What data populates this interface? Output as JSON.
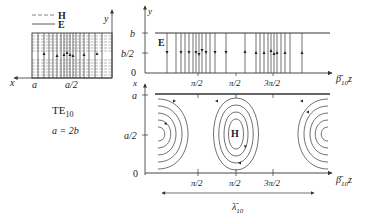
{
  "legend": {
    "h_label": "H",
    "e_label": "E",
    "h_style": "dashed",
    "e_style": "solid"
  },
  "cross_section": {
    "x_axis_label": "x",
    "y_axis_label": "y",
    "tick_a": "a",
    "tick_a_half": "a/2"
  },
  "mode": {
    "name": "TE",
    "subscript": "10",
    "relation": "a = 2b"
  },
  "e_plot": {
    "field_label": "E",
    "y_axis_label": "y",
    "y_ticks": [
      "b",
      "b/2",
      "0"
    ],
    "x_ticks": [
      "π/2",
      "π/2",
      "3π/2"
    ],
    "x_axis_label": "β̄",
    "x_axis_sub": "10",
    "x_axis_var": "z"
  },
  "h_plot": {
    "field_label": "H",
    "x_axis_top_label": "x",
    "y_ticks": [
      "a",
      "a/2",
      "0"
    ],
    "x_ticks": [
      "π/2",
      "π/2",
      "3π/2"
    ],
    "x_axis_label": "β̄",
    "x_axis_sub": "10",
    "x_axis_var": "z"
  },
  "wavelength": {
    "symbol": "λ̄",
    "sub": "10"
  },
  "colors": {
    "line": "#333333",
    "dashed": "#777777",
    "background": "#ffffff"
  }
}
